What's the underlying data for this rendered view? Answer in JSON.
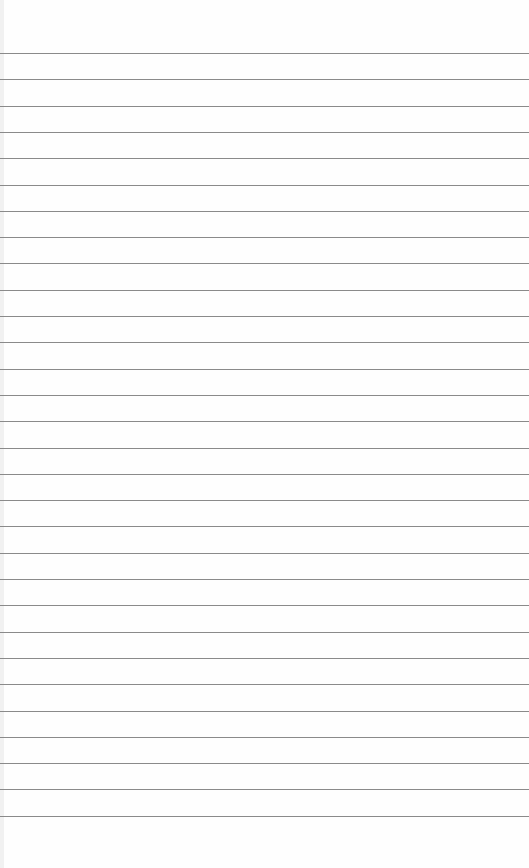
{
  "paper": {
    "type": "lined notebook paper",
    "background_color": "#fefefe",
    "line_color": "#8a8a8a",
    "line_count": 30,
    "first_line_y": 53,
    "line_spacing": 26.3
  }
}
